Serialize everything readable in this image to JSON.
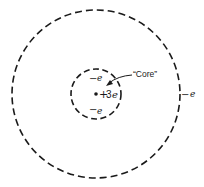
{
  "diagram": {
    "title": "",
    "outer_shell": {
      "cx": 96,
      "cy": 94,
      "r": 84,
      "stroke": "#1a1a1a"
    },
    "inner_shell": {
      "cx": 96,
      "cy": 94,
      "r": 25,
      "stroke": "#1a1a1a"
    },
    "nucleus": {
      "charge_label": "+3e",
      "plus": "+",
      "value": "3",
      "unit": "e"
    },
    "inner_electrons": [
      {
        "minus": "−",
        "unit": "e"
      },
      {
        "minus": "−",
        "unit": "e"
      }
    ],
    "outer_electron": {
      "minus": "−",
      "unit": "e"
    },
    "core_label": "“Core”"
  }
}
